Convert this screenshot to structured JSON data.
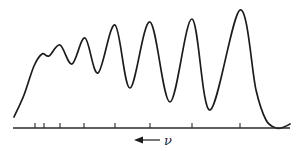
{
  "chart_data": {
    "type": "line",
    "title": "",
    "xlabel": "ν",
    "xlabel_arrow": "left",
    "ylabel": "",
    "grid": false,
    "legend": null,
    "axis": {
      "x_start_px": 13,
      "x_end_px": 290,
      "baseline_px": 128
    },
    "ticks_px": [
      35,
      44,
      60,
      84,
      115,
      150,
      192,
      240
    ],
    "tick_labels": [],
    "series": [
      {
        "name": "spectrum",
        "description": "Vibrational progression: bands increase in intensity toward lower frequency (right), final intense band then steep drop to baseline",
        "points_px": [
          [
            14,
            117
          ],
          [
            24,
            95
          ],
          [
            34,
            66
          ],
          [
            42,
            54
          ],
          [
            49,
            56
          ],
          [
            60,
            45
          ],
          [
            72,
            64
          ],
          [
            85,
            38
          ],
          [
            98,
            73
          ],
          [
            115,
            25
          ],
          [
            130,
            88
          ],
          [
            150,
            22
          ],
          [
            170,
            102
          ],
          [
            192,
            19
          ],
          [
            210,
            110
          ],
          [
            240,
            10
          ],
          [
            256,
            90
          ],
          [
            266,
            120
          ],
          [
            276,
            128
          ],
          [
            284,
            127
          ],
          [
            290,
            124
          ]
        ],
        "peaks": [
          {
            "x_px": 42,
            "relative_height": 0.63,
            "kind": "shoulder"
          },
          {
            "x_px": 60,
            "relative_height": 0.71
          },
          {
            "x_px": 85,
            "relative_height": 0.76
          },
          {
            "x_px": 115,
            "relative_height": 0.87
          },
          {
            "x_px": 150,
            "relative_height": 0.9
          },
          {
            "x_px": 192,
            "relative_height": 0.92
          },
          {
            "x_px": 240,
            "relative_height": 1.0
          }
        ]
      }
    ]
  },
  "labels": {
    "nu": "ν"
  }
}
